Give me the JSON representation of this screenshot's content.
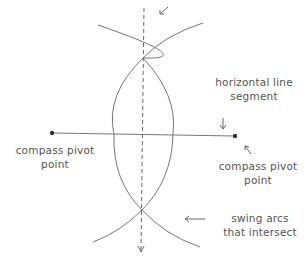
{
  "diagram": {
    "labels": {
      "left_pivot": [
        "compass pivot",
        "point"
      ],
      "right_pivot": [
        "compass pivot",
        "point"
      ],
      "segment": [
        "horizontal line",
        "segment"
      ],
      "arcs": [
        "swing arcs",
        "that intersect"
      ]
    },
    "colors": {
      "stroke": "#6a6a6a",
      "text": "#555555",
      "dot": "#333333"
    }
  }
}
